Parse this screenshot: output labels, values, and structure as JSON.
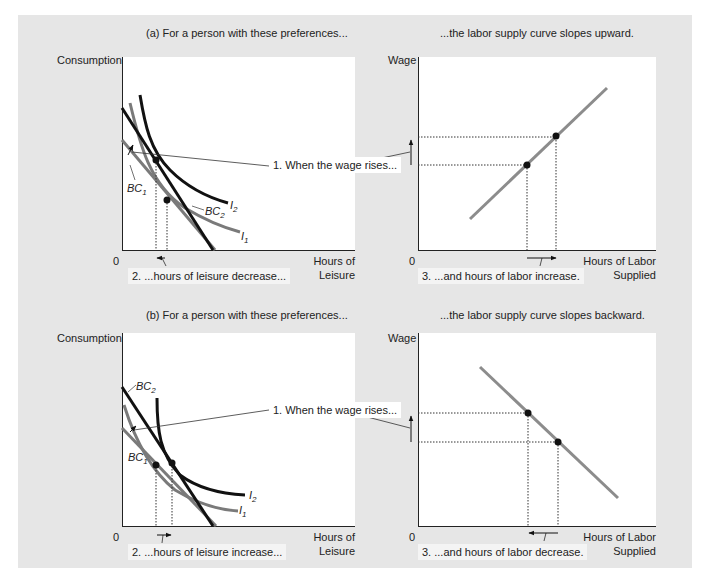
{
  "panel_a": {
    "left_title": "(a) For a person with these preferences...",
    "right_title": "...the labor supply curve slopes upward.",
    "left_chart": {
      "y_label": "Consumption",
      "x_label_line1": "Hours of",
      "x_label_line2": "Leisure",
      "origin": "0",
      "curves": {
        "bc1": "BC",
        "bc1_sub": "1",
        "bc2": "BC",
        "bc2_sub": "2",
        "i1": "I",
        "i1_sub": "1",
        "i2": "I",
        "i2_sub": "2"
      }
    },
    "right_chart": {
      "y_label": "Wage",
      "x_label_line1": "Hours of Labor",
      "x_label_line2": "Supplied",
      "origin": "0"
    },
    "callout_1": "1. When the wage rises...",
    "callout_2": "2. ...hours of leisure decrease...",
    "callout_3": "3. ...and hours of labor increase."
  },
  "panel_b": {
    "left_title": "(b) For a person with these preferences...",
    "right_title": "...the labor supply curve slopes backward.",
    "left_chart": {
      "y_label": "Consumption",
      "x_label_line1": "Hours of",
      "x_label_line2": "Leisure",
      "origin": "0",
      "curves": {
        "bc1": "BC",
        "bc1_sub": "1",
        "bc2": "BC",
        "bc2_sub": "2",
        "i1": "I",
        "i1_sub": "1",
        "i2": "I",
        "i2_sub": "2"
      }
    },
    "right_chart": {
      "y_label": "Wage",
      "x_label_line1": "Hours of Labor",
      "x_label_line2": "Supplied",
      "origin": "0"
    },
    "callout_1": "1. When the wage rises...",
    "callout_2": "2. ...hours of leisure increase...",
    "callout_3": "3. ...and hours of labor decrease."
  },
  "colors": {
    "background_panel": "#e6e6e6",
    "chart_bg": "#ffffff",
    "black_curve": "#111111",
    "gray_curve": "#7a7a7a",
    "supply_curve": "#8c8c8c"
  }
}
